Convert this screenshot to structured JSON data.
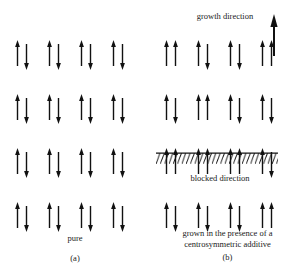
{
  "figure": {
    "growth_direction_label": "growth direction",
    "blocked_direction_label": "blocked direction",
    "growth_arrow_icon": "up-arrow-icon",
    "barrier_icon": "hatched-barrier-icon"
  },
  "panel_a": {
    "caption_text": "pure",
    "caption_tag": "(a)",
    "rows": 4,
    "columns": 4,
    "pattern": [
      [
        "up-down",
        "up-down",
        "up-down",
        "up-down"
      ],
      [
        "up-down",
        "up-down",
        "up-down",
        "up-down"
      ],
      [
        "up-down",
        "up-down",
        "up-down",
        "up-down"
      ],
      [
        "up-down",
        "up-down",
        "up-down",
        "up-down"
      ]
    ]
  },
  "panel_b": {
    "caption_text": "grown in the presence of a centrosymmetric additive",
    "caption_tag": "(b)",
    "rows": 4,
    "columns": 4,
    "pattern": [
      [
        "up-up",
        "up-down",
        "up-down",
        "up-up"
      ],
      [
        "up-down",
        "up-up",
        "up-down",
        "up-down"
      ],
      [
        "up-up",
        "up-up",
        "up-up",
        "up-down"
      ],
      [
        "up-down",
        "up-down",
        "up-down",
        "up-up"
      ]
    ]
  },
  "colors": {
    "ink": "#111111",
    "background": "#ffffff"
  }
}
